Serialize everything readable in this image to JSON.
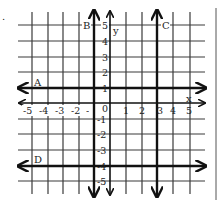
{
  "figure": {
    "title": "",
    "marker": "."
  },
  "axes": {
    "x_label": "x",
    "y_label": "y",
    "origin_label": "0",
    "x_ticks": [
      "-5",
      "-4",
      "-3",
      "-2",
      "-1",
      "1",
      "2",
      "3",
      "4",
      "5"
    ],
    "y_ticks": [
      "5",
      "4",
      "3",
      "2",
      "1",
      "-1",
      "-2",
      "-3",
      "-4",
      "-5"
    ]
  },
  "lines": [
    {
      "label": "A",
      "orientation": "horizontal",
      "equation": "y = 1"
    },
    {
      "label": "B",
      "orientation": "vertical",
      "equation": "x = -1"
    },
    {
      "label": "C",
      "orientation": "vertical",
      "equation": "x = 3"
    },
    {
      "label": "D",
      "orientation": "horizontal",
      "equation": "y = -4"
    }
  ],
  "colors": {
    "ink": "#111111",
    "grid": "#3a3a3a",
    "background": "#ffffff"
  }
}
